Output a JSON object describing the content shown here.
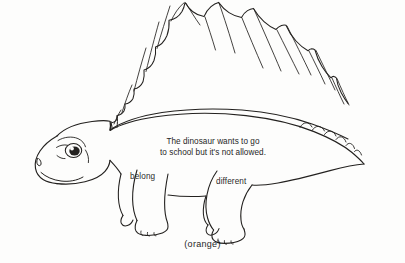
{
  "worksheet": {
    "sentence": "The dinosaur wants to go\nto school but it's not allowed.",
    "color_caption": "(orange)",
    "leg_labels": {
      "front": "belong",
      "back": "different"
    },
    "subject": "dimetrodon-dinosaur-line-drawing",
    "ink_color": "#23211f",
    "text_color": "#1f1f1f",
    "background_color": "#fdfdfc"
  }
}
